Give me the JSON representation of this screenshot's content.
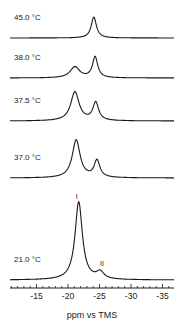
{
  "chart_data": {
    "type": "line",
    "title": "",
    "xlabel": "ppm vs TMS",
    "ylabel": "",
    "xlim": [
      -10,
      -36.5
    ],
    "x_reversed": true,
    "grid": false,
    "legend": "none",
    "x_ticks": {
      "major": [
        -15,
        -20,
        -25,
        -30,
        -35
      ],
      "major_labels": [
        "-15",
        "-20",
        "-25",
        "-30",
        "-35"
      ],
      "minor_step": 1
    },
    "stacked_spectra": [
      {
        "label": "45.0 °C",
        "baseline_y": 38,
        "peaks": [
          {
            "ppm": -24.1,
            "height": 21,
            "width": 0.5
          }
        ]
      },
      {
        "label": "38.0 °C",
        "baseline_y": 78,
        "peaks": [
          {
            "ppm": -21.1,
            "height": 11,
            "width": 0.9
          },
          {
            "ppm": -24.3,
            "height": 21,
            "width": 0.5
          }
        ]
      },
      {
        "label": "37.5 °C",
        "baseline_y": 121,
        "peaks": [
          {
            "ppm": -21.1,
            "height": 29,
            "width": 0.8
          },
          {
            "ppm": -24.4,
            "height": 18,
            "width": 0.55
          }
        ]
      },
      {
        "label": "37.0 °C",
        "baseline_y": 178,
        "peaks": [
          {
            "ppm": -21.3,
            "height": 38,
            "width": 0.75
          },
          {
            "ppm": -24.6,
            "height": 17,
            "width": 0.55
          }
        ]
      },
      {
        "label": "21.0 °C",
        "baseline_y": 280,
        "peaks": [
          {
            "ppm": -21.7,
            "height": 78,
            "width": 0.7
          },
          {
            "ppm": -25.1,
            "height": 7,
            "width": 0.7
          }
        ]
      }
    ],
    "annotations": [
      {
        "text": "I",
        "ppm": -21.4,
        "y": 199
      },
      {
        "text": "II",
        "ppm": -25.4,
        "y": 266
      }
    ]
  },
  "layout": {
    "plot_x0": 10,
    "plot_x1": 174,
    "px_per_ppm": 6.3,
    "ppm_at_x68": -20,
    "axis_y": 288,
    "label_x": 14,
    "line_color": "#1a1a1a"
  }
}
